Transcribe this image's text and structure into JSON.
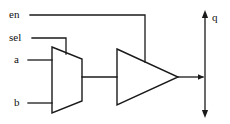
{
  "diagram": {
    "stroke_color": "#1a1a1a",
    "background_color": "#ffffff",
    "labels": {
      "enable": "en",
      "select": "sel",
      "input_a": "a",
      "input_b": "b",
      "output_q": "q"
    },
    "components": [
      {
        "name": "multiplexer",
        "shape": "trapezoid",
        "inputs": [
          "a",
          "b"
        ],
        "control": "sel",
        "outputs": [
          "mux-out"
        ]
      },
      {
        "name": "tri-state-buffer",
        "shape": "triangle",
        "inputs": [
          "mux-out"
        ],
        "control": "en",
        "outputs": [
          "q"
        ]
      },
      {
        "name": "output-net-q",
        "shape": "double-arrow-vertical",
        "label": "q"
      }
    ],
    "nets": [
      {
        "name": "en-net",
        "from": "en",
        "to": "tri-state-buffer.control"
      },
      {
        "name": "sel-net",
        "from": "sel",
        "to": "multiplexer.control"
      },
      {
        "name": "a-net",
        "from": "a",
        "to": "multiplexer.in0"
      },
      {
        "name": "b-net",
        "from": "b",
        "to": "multiplexer.in1"
      },
      {
        "name": "mux-out-net",
        "from": "multiplexer.out",
        "to": "tri-state-buffer.in"
      },
      {
        "name": "q-net",
        "from": "tri-state-buffer.out",
        "to": "output-net-q"
      }
    ]
  }
}
